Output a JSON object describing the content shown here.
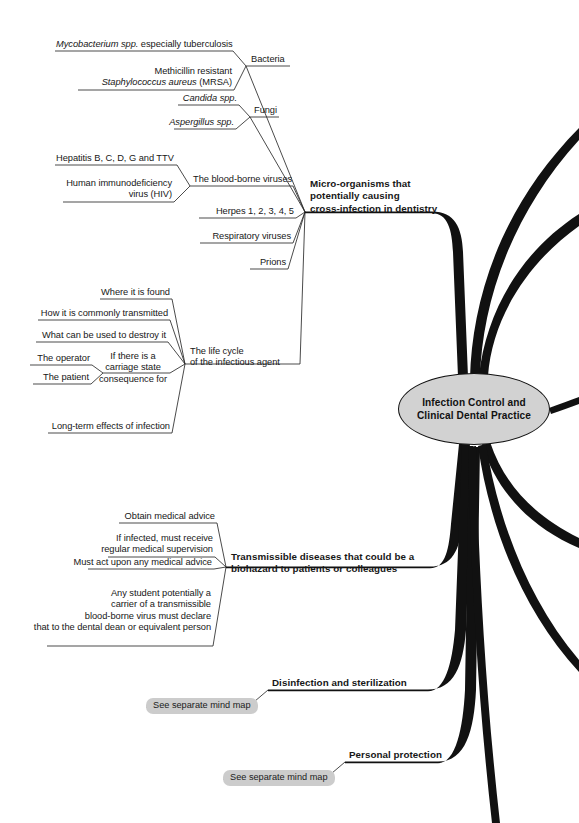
{
  "diagram": {
    "type": "mind-map",
    "title": "Infection Control and Clinical Dental Practice",
    "center": {
      "line1": "Infection Control and",
      "line2": "Clinical Dental Practice"
    },
    "colors": {
      "background": "#ffffff",
      "branch": "#111111",
      "node_fill": "#d2d2d2",
      "pill_fill": "#cccccc",
      "text": "#171717"
    },
    "branches": [
      {
        "id": "micro-organisms",
        "label_lines": [
          "Micro-organisms that",
          "potentially causing",
          "cross-infection in dentistry"
        ],
        "children": [
          {
            "id": "bacteria",
            "label": "Bacteria",
            "children": [
              {
                "id": "mycobacterium",
                "lines": [
                  "Mycobacterium spp. especially tuberculosis"
                ],
                "italic_prefix": "Mycobacterium spp."
              },
              {
                "id": "mrsa",
                "lines": [
                  "Methicillin resistant",
                  "Staphylococcus aureus (MRSA)"
                ],
                "italic_prefix": "Staphylococcus aureus"
              }
            ]
          },
          {
            "id": "fungi",
            "label": "Fungi",
            "children": [
              {
                "id": "candida",
                "lines": [
                  "Candida spp."
                ],
                "italic": true
              },
              {
                "id": "aspergillus",
                "lines": [
                  "Aspergillus spp."
                ],
                "italic": true
              }
            ]
          },
          {
            "id": "blood-borne-viruses",
            "label": "The blood-borne viruses",
            "children": [
              {
                "id": "hepatitis",
                "lines": [
                  "Hepatitis B, C, D, G and TTV"
                ]
              },
              {
                "id": "hiv",
                "lines": [
                  "Human immunodeficiency",
                  "virus (HIV)"
                ]
              }
            ]
          },
          {
            "id": "herpes",
            "label": "Herpes 1, 2, 3, 4, 5",
            "children": []
          },
          {
            "id": "respiratory-viruses",
            "label": "Respiratory viruses",
            "children": []
          },
          {
            "id": "prions",
            "label": "Prions",
            "children": []
          }
        ]
      },
      {
        "id": "life-cycle",
        "label_lines": [
          "The life cycle",
          "of the infectious agent"
        ],
        "children": [
          {
            "id": "where-found",
            "label": "Where it is found"
          },
          {
            "id": "how-transmitted",
            "label": "How it is commonly transmitted"
          },
          {
            "id": "destroy",
            "label": "What can be used to destroy it"
          },
          {
            "id": "carriage-state",
            "label_lines": [
              "If there is a",
              "carriage state",
              "consequence for"
            ],
            "children": [
              {
                "id": "operator",
                "label": "The operator"
              },
              {
                "id": "patient",
                "label": "The patient"
              }
            ]
          },
          {
            "id": "long-term",
            "label": "Long-term effects of infection"
          }
        ]
      },
      {
        "id": "transmissible-diseases",
        "label_lines": [
          "Transmissible diseases that could be a",
          "biohazard to patients or colleagues"
        ],
        "children": [
          {
            "id": "obtain-advice",
            "label": "Obtain medical advice"
          },
          {
            "id": "supervision",
            "label_lines": [
              "If infected, must receive",
              "regular medical supervision"
            ]
          },
          {
            "id": "act-upon-advice",
            "label": "Must act upon any medical advice"
          },
          {
            "id": "declare-carrier",
            "label_lines": [
              "Any student potentially a",
              "carrier of a transmissible",
              "blood-borne virus must declare",
              "that to the dental dean or equivalent person"
            ]
          }
        ]
      },
      {
        "id": "disinfection",
        "label": "Disinfection and sterilization",
        "children": [
          {
            "id": "see-map-1",
            "label": "See separate mind map",
            "style": "pill"
          }
        ]
      },
      {
        "id": "personal-protection",
        "label": "Personal protection",
        "children": [
          {
            "id": "see-map-2",
            "label": "See separate mind map",
            "style": "pill"
          }
        ]
      }
    ],
    "offscreen_branch_count": 6
  }
}
